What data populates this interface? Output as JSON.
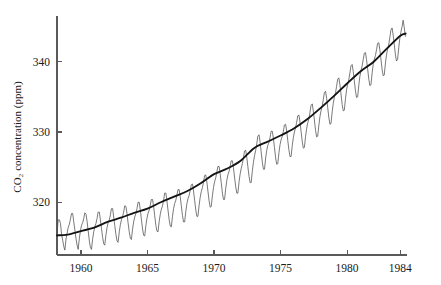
{
  "chart_data": {
    "type": "line",
    "title": "",
    "xlabel": "",
    "ylabel": "CO2 concentration (ppm)",
    "ylabel_display": "CO₂ concentration (ppm)",
    "xlim": [
      1958.2,
      1984.5
    ],
    "ylim": [
      312.5,
      346.5
    ],
    "xticks": [
      1960,
      1965,
      1970,
      1975,
      1980,
      1984
    ],
    "xticklabels": [
      "1960",
      "1965",
      "1970",
      "1975",
      "1980",
      "1984"
    ],
    "yticks": [
      320,
      330,
      340
    ],
    "yticklabels": [
      "320",
      "330",
      "340"
    ],
    "grid": false,
    "legend": false,
    "legend_position": "none",
    "axis_color": "#5a5a5a",
    "series": [
      {
        "name": "Monthly mean CO2 (seasonal cycle)",
        "color": "#4d4d4d",
        "linewidth": 0.75,
        "x": [
          1958.21,
          1958.29,
          1958.38,
          1958.46,
          1958.54,
          1958.63,
          1958.71,
          1958.79,
          1958.88,
          1958.96,
          1959.04,
          1959.13,
          1959.21,
          1959.29,
          1959.38,
          1959.46,
          1959.54,
          1959.63,
          1959.71,
          1959.79,
          1959.88,
          1959.96,
          1960.04,
          1960.13,
          1960.21,
          1960.29,
          1960.38,
          1960.46,
          1960.54,
          1960.63,
          1960.71,
          1960.79,
          1960.88,
          1960.96,
          1961.04,
          1961.13,
          1961.21,
          1961.29,
          1961.38,
          1961.46,
          1961.54,
          1961.63,
          1961.71,
          1961.79,
          1961.88,
          1961.96,
          1962.04,
          1962.13,
          1962.21,
          1962.29,
          1962.38,
          1962.46,
          1962.54,
          1962.63,
          1962.71,
          1962.79,
          1962.88,
          1962.96,
          1963.04,
          1963.13,
          1963.21,
          1963.29,
          1963.38,
          1963.46,
          1963.54,
          1963.63,
          1963.71,
          1963.79,
          1963.88,
          1963.96,
          1964.04,
          1964.13,
          1964.21,
          1964.29,
          1964.38,
          1964.46,
          1964.54,
          1964.63,
          1964.71,
          1964.79,
          1964.88,
          1964.96,
          1965.04,
          1965.13,
          1965.21,
          1965.29,
          1965.38,
          1965.46,
          1965.54,
          1965.63,
          1965.71,
          1965.79,
          1965.88,
          1965.96,
          1966.04,
          1966.13,
          1966.21,
          1966.29,
          1966.38,
          1966.46,
          1966.54,
          1966.63,
          1966.71,
          1966.79,
          1966.88,
          1966.96,
          1967.04,
          1967.13,
          1967.21,
          1967.29,
          1967.38,
          1967.46,
          1967.54,
          1967.63,
          1967.71,
          1967.79,
          1967.88,
          1967.96,
          1968.04,
          1968.13,
          1968.21,
          1968.29,
          1968.38,
          1968.46,
          1968.54,
          1968.63,
          1968.71,
          1968.79,
          1968.88,
          1968.96,
          1969.04,
          1969.13,
          1969.21,
          1969.29,
          1969.38,
          1969.46,
          1969.54,
          1969.63,
          1969.71,
          1969.79,
          1969.88,
          1969.96,
          1970.04,
          1970.13,
          1970.21,
          1970.29,
          1970.38,
          1970.46,
          1970.54,
          1970.63,
          1970.71,
          1970.79,
          1970.88,
          1970.96,
          1971.04,
          1971.13,
          1971.21,
          1971.29,
          1971.38,
          1971.46,
          1971.54,
          1971.63,
          1971.71,
          1971.79,
          1971.88,
          1971.96,
          1972.04,
          1972.13,
          1972.21,
          1972.29,
          1972.38,
          1972.46,
          1972.54,
          1972.63,
          1972.71,
          1972.79,
          1972.88,
          1972.96,
          1973.04,
          1973.13,
          1973.21,
          1973.29,
          1973.38,
          1973.46,
          1973.54,
          1973.63,
          1973.71,
          1973.79,
          1973.88,
          1973.96,
          1974.04,
          1974.13,
          1974.21,
          1974.29,
          1974.38,
          1974.46,
          1974.54,
          1974.63,
          1974.71,
          1974.79,
          1974.88,
          1974.96,
          1975.04,
          1975.13,
          1975.21,
          1975.29,
          1975.38,
          1975.46,
          1975.54,
          1975.63,
          1975.71,
          1975.79,
          1975.88,
          1975.96,
          1976.04,
          1976.13,
          1976.21,
          1976.29,
          1976.38,
          1976.46,
          1976.54,
          1976.63,
          1976.71,
          1976.79,
          1976.88,
          1976.96,
          1977.04,
          1977.13,
          1977.21,
          1977.29,
          1977.38,
          1977.46,
          1977.54,
          1977.63,
          1977.71,
          1977.79,
          1977.88,
          1977.96,
          1978.04,
          1978.13,
          1978.21,
          1978.29,
          1978.38,
          1978.46,
          1978.54,
          1978.63,
          1978.71,
          1978.79,
          1978.88,
          1978.96,
          1979.04,
          1979.13,
          1979.21,
          1979.29,
          1979.38,
          1979.46,
          1979.54,
          1979.63,
          1979.71,
          1979.79,
          1979.88,
          1979.96,
          1980.04,
          1980.13,
          1980.21,
          1980.29,
          1980.38,
          1980.46,
          1980.54,
          1980.63,
          1980.71,
          1980.79,
          1980.88,
          1980.96,
          1981.04,
          1981.13,
          1981.21,
          1981.29,
          1981.38,
          1981.46,
          1981.54,
          1981.63,
          1981.71,
          1981.79,
          1981.88,
          1981.96,
          1982.04,
          1982.13,
          1982.21,
          1982.29,
          1982.38,
          1982.46,
          1982.54,
          1982.63,
          1982.71,
          1982.79,
          1982.88,
          1982.96,
          1983.04,
          1983.13,
          1983.21,
          1983.29,
          1983.38,
          1983.46,
          1983.54,
          1983.63,
          1983.71,
          1983.79,
          1983.88,
          1983.96,
          1984.04,
          1984.13,
          1984.21,
          1984.29,
          1984.38
        ],
        "y": [
          315.7,
          317.5,
          317.5,
          317.0,
          315.5,
          314.6,
          313.7,
          313.2,
          314.8,
          315.6,
          316.4,
          316.9,
          317.6,
          318.4,
          318.4,
          317.2,
          316.1,
          314.8,
          313.9,
          313.3,
          314.9,
          315.9,
          316.7,
          317.1,
          317.7,
          318.5,
          318.3,
          317.3,
          316.0,
          314.5,
          313.6,
          313.3,
          314.8,
          315.8,
          316.5,
          317.0,
          317.7,
          318.6,
          318.6,
          317.5,
          316.3,
          315.0,
          314.1,
          313.9,
          315.4,
          316.4,
          317.1,
          317.5,
          318.2,
          319.1,
          319.1,
          317.9,
          316.7,
          315.4,
          314.5,
          314.3,
          315.8,
          316.8,
          317.5,
          318.0,
          318.6,
          319.5,
          319.4,
          318.4,
          317.1,
          315.8,
          314.9,
          314.7,
          316.2,
          317.2,
          317.9,
          318.4,
          319.1,
          320.0,
          320.0,
          318.9,
          317.6,
          316.2,
          315.3,
          315.2,
          316.7,
          317.7,
          318.4,
          318.9,
          319.6,
          320.4,
          320.4,
          319.4,
          318.1,
          316.7,
          315.9,
          315.8,
          317.3,
          318.3,
          319.0,
          319.5,
          320.3,
          321.3,
          321.3,
          320.2,
          318.9,
          317.5,
          316.6,
          316.5,
          318.0,
          319.1,
          319.8,
          320.3,
          321.0,
          321.8,
          321.8,
          320.8,
          319.5,
          318.1,
          317.2,
          317.2,
          318.7,
          319.8,
          320.5,
          321.0,
          321.7,
          322.5,
          322.6,
          321.6,
          320.3,
          318.9,
          318.0,
          318.0,
          319.6,
          320.7,
          321.5,
          322.1,
          322.9,
          323.8,
          323.9,
          322.9,
          321.6,
          320.2,
          319.3,
          319.4,
          321.0,
          322.1,
          322.9,
          323.5,
          324.3,
          325.1,
          325.1,
          324.1,
          322.8,
          321.3,
          320.4,
          320.4,
          322.0,
          323.1,
          323.9,
          324.4,
          325.1,
          325.9,
          325.9,
          324.9,
          323.6,
          322.2,
          321.3,
          321.3,
          322.9,
          324.0,
          324.8,
          325.5,
          326.3,
          327.3,
          327.4,
          326.4,
          325.1,
          323.7,
          322.8,
          322.8,
          324.5,
          325.7,
          326.6,
          327.4,
          328.3,
          329.4,
          329.6,
          328.6,
          327.2,
          325.7,
          324.7,
          324.7,
          326.3,
          327.4,
          328.1,
          328.5,
          329.2,
          330.1,
          330.1,
          329.1,
          327.8,
          326.3,
          325.4,
          325.5,
          327.1,
          328.2,
          328.9,
          329.4,
          330.1,
          331.0,
          331.1,
          330.1,
          328.8,
          327.4,
          326.5,
          326.5,
          328.1,
          329.2,
          330.0,
          330.6,
          331.4,
          332.3,
          332.4,
          331.4,
          330.1,
          328.6,
          327.7,
          327.8,
          329.4,
          330.5,
          331.3,
          331.9,
          332.8,
          333.8,
          334.0,
          333.0,
          331.7,
          330.2,
          329.3,
          329.4,
          331.0,
          332.2,
          333.0,
          333.7,
          334.6,
          335.6,
          335.8,
          334.8,
          333.5,
          332.0,
          331.1,
          331.2,
          332.9,
          334.1,
          334.9,
          335.6,
          336.5,
          337.5,
          337.7,
          336.7,
          335.4,
          333.9,
          333.0,
          333.1,
          334.8,
          336.0,
          336.8,
          337.5,
          338.4,
          339.4,
          339.6,
          338.6,
          337.3,
          335.8,
          334.9,
          335.0,
          336.7,
          337.9,
          338.7,
          339.4,
          340.3,
          341.2,
          341.3,
          340.3,
          339.0,
          337.5,
          336.6,
          336.7,
          338.4,
          339.6,
          340.3,
          340.9,
          341.7,
          342.6,
          342.7,
          341.7,
          340.4,
          338.9,
          338.0,
          338.1,
          339.8,
          341.0,
          341.8,
          342.5,
          343.4,
          344.5,
          344.8,
          343.8,
          342.5,
          341.0,
          340.1,
          340.3,
          342.0,
          343.3,
          344.2,
          345.0,
          345.9,
          344.9,
          343.6
        ]
      },
      {
        "name": "Smoothed long-term trend",
        "color": "#141414",
        "linewidth": 1.85,
        "x": [
          1958.2,
          1959.0,
          1960.0,
          1961.0,
          1962.0,
          1963.0,
          1964.0,
          1965.0,
          1966.0,
          1967.0,
          1968.0,
          1969.0,
          1970.0,
          1971.0,
          1972.0,
          1973.0,
          1974.0,
          1975.0,
          1976.0,
          1977.0,
          1978.0,
          1979.0,
          1980.0,
          1981.0,
          1982.0,
          1983.0,
          1984.0,
          1984.4
        ],
        "y": [
          315.3,
          315.4,
          315.9,
          316.4,
          317.2,
          317.8,
          318.5,
          319.1,
          320.0,
          320.8,
          321.6,
          322.7,
          324.0,
          324.8,
          325.9,
          327.7,
          328.6,
          329.5,
          330.5,
          331.8,
          333.4,
          335.1,
          336.9,
          338.6,
          340.0,
          341.9,
          343.7,
          344.0
        ]
      }
    ]
  },
  "layout": {
    "plot_left": 57,
    "plot_right": 407,
    "plot_top": 16,
    "plot_bottom": 255,
    "tick_len": 5
  }
}
